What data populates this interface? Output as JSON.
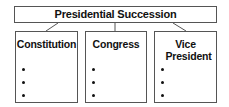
{
  "diagram": {
    "root": {
      "label": "Presidential Succession"
    },
    "children": [
      {
        "label": "Constitution",
        "bullets": [
          "",
          "",
          ""
        ]
      },
      {
        "label": "Congress",
        "bullets": [
          "",
          "",
          ""
        ]
      },
      {
        "label": "Vice President",
        "bullets": [
          "",
          "",
          ""
        ]
      }
    ]
  }
}
